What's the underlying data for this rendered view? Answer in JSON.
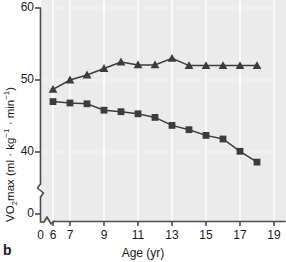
{
  "figure": {
    "panel_label": "b",
    "background_color": "#ebebeb",
    "gridline_color": "#ffffff",
    "axis_color": "#4d4d4d",
    "series_color": "#3c3c3c"
  },
  "chart_data": {
    "type": "line",
    "title": "",
    "xlabel": "Age (yr)",
    "ylabel": "VO2max (ml · kg−1 · min−1)",
    "ylabel_parts": {
      "prefix": "V",
      "subscript": "O",
      "sub2": "2",
      "rest": "max (ml · kg",
      "sup1": "−1",
      "mid": " · min",
      "sup2": "−1",
      "suffix": ")"
    },
    "xlim": [
      0,
      19.6
    ],
    "ylim": [
      0,
      60
    ],
    "y_axis_break": true,
    "x_axis_break": true,
    "grid": true,
    "grid_axis": "x",
    "xticks": [
      0,
      6,
      7,
      9,
      11,
      13,
      15,
      17,
      19
    ],
    "xtick_labels": [
      "0",
      "6",
      "7",
      "9",
      "11",
      "13",
      "15",
      "17",
      "19"
    ],
    "yticks": [
      0,
      40,
      50,
      60
    ],
    "ytick_labels": [
      "0",
      "40",
      "50",
      "60"
    ],
    "legend": [],
    "legend_position": "none",
    "x": [
      6,
      7,
      8,
      9,
      10,
      11,
      12,
      13,
      14,
      15,
      16,
      17,
      18
    ],
    "series": [
      {
        "name": "boys",
        "marker": "triangle",
        "values": [
          48.7,
          50.0,
          50.7,
          51.6,
          52.5,
          52.1,
          52.1,
          53.0,
          52.0,
          52.0,
          52.0,
          52.0,
          52.0
        ]
      },
      {
        "name": "girls",
        "marker": "square",
        "values": [
          47.0,
          46.8,
          46.7,
          45.8,
          45.6,
          45.3,
          44.8,
          43.7,
          43.1,
          42.3,
          41.8,
          40.1,
          38.6
        ]
      }
    ]
  }
}
